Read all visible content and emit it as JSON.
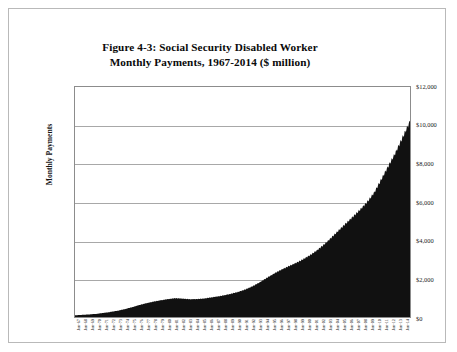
{
  "figure": {
    "title_line1": "Figure 4-3: Social Security Disabled Worker",
    "title_line2": "Monthly Payments,  1967-2014 ($ million)"
  },
  "chart_data": {
    "type": "area",
    "title": "Figure 4-3: Social Security Disabled Worker Monthly Payments,  1967-2014 ($ million)",
    "xlabel": "",
    "ylabel": "Monthly Payments",
    "ylim": [
      0,
      12000
    ],
    "ytick_values": [
      0,
      2000,
      4000,
      6000,
      8000,
      10000,
      12000
    ],
    "ytick_labels": [
      "$0",
      "$2,000",
      "$4,000",
      "$6,000",
      "$8,000",
      "$10,000",
      "$12,000"
    ],
    "grid": true,
    "legend": "none",
    "series_color": "#111111",
    "categories": [
      "Jan-67",
      "Jan-68",
      "Jan-69",
      "Jan-70",
      "Jan-71",
      "Jan-72",
      "Jan-73",
      "Jan-74",
      "Jan-75",
      "Jan-76",
      "Jan-77",
      "Jan-78",
      "Jan-79",
      "Jan-80",
      "Jan-81",
      "Jan-82",
      "Jan-83",
      "Jan-84",
      "Jan-85",
      "Jan-86",
      "Jan-87",
      "Jan-88",
      "Jan-89",
      "Jan-90",
      "Jan-91",
      "Jan-92",
      "Jan-93",
      "Jan-94",
      "Jan-95",
      "Jan-96",
      "Jan-97",
      "Jan-98",
      "Jan-99",
      "Jan-00",
      "Jan-01",
      "Jan-02",
      "Jan-03",
      "Jan-04",
      "Jan-05",
      "Jan-06",
      "Jan-07",
      "Jan-08",
      "Jan-09",
      "Jan-10",
      "Jan-11",
      "Jan-12",
      "Jan-13",
      "Jan-14"
    ],
    "values": [
      90,
      110,
      135,
      165,
      210,
      265,
      330,
      410,
      510,
      620,
      720,
      800,
      870,
      930,
      980,
      960,
      930,
      930,
      960,
      1010,
      1070,
      1140,
      1220,
      1320,
      1450,
      1620,
      1830,
      2060,
      2280,
      2480,
      2650,
      2820,
      3010,
      3230,
      3490,
      3800,
      4150,
      4520,
      4880,
      5230,
      5600,
      6000,
      6500,
      7200,
      7900,
      8600,
      9400,
      10200
    ],
    "peak_value": 10200,
    "peak_category": "Jan-14",
    "start_value": 90,
    "start_category": "Jan-67"
  }
}
